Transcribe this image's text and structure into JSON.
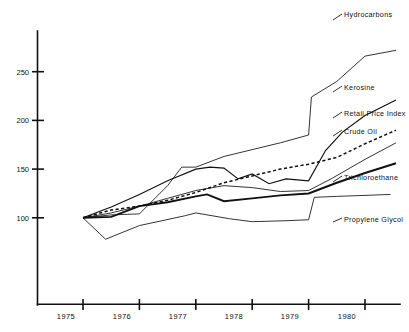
{
  "chart_data": {
    "type": "line",
    "title": "",
    "subtitle": "",
    "xlabel": "",
    "ylabel": "",
    "xlim": [
      1975,
      1980.9
    ],
    "ylim": [
      55,
      290
    ],
    "yticks": [
      100,
      150,
      200,
      250
    ],
    "ytick_labels": [
      "100",
      "150",
      "200",
      "250"
    ],
    "xticks": [
      1975,
      1976,
      1977,
      1978,
      1979,
      1980
    ],
    "xtick_labels": [
      "1975",
      "1976",
      "1977",
      "1978",
      "1979",
      "1980"
    ],
    "grid": false,
    "legend_position": "right-inline-labels",
    "index_base": "1975 = 100",
    "series": [
      {
        "name": "Hydrocarbons",
        "style": "thin-solid",
        "color": "#111111",
        "x": [
          1975.0,
          1975.5,
          1976.0,
          1976.5,
          1976.75,
          1977.0,
          1977.5,
          1978.0,
          1978.5,
          1979.0,
          1979.05,
          1979.5,
          1980.0,
          1980.55
        ],
        "values": [
          100,
          103,
          104,
          133,
          152,
          152,
          163,
          170,
          177,
          185,
          224,
          240,
          266,
          272
        ]
      },
      {
        "name": "Kerosine",
        "style": "medium-solid",
        "color": "#111111",
        "x": [
          1975.0,
          1975.5,
          1976.0,
          1976.5,
          1977.0,
          1977.25,
          1977.5,
          1977.75,
          1978.0,
          1978.3,
          1978.6,
          1979.0,
          1979.3,
          1979.6,
          1980.0,
          1980.55
        ],
        "values": [
          100,
          111,
          124,
          138,
          150,
          152,
          151,
          140,
          145,
          135,
          140,
          138,
          169,
          188,
          205,
          221
        ]
      },
      {
        "name": "Retail Price Index",
        "style": "dashed",
        "color": "#111111",
        "x": [
          1975.0,
          1975.5,
          1976.0,
          1976.5,
          1977.0,
          1977.5,
          1978.0,
          1978.5,
          1979.0,
          1979.5,
          1980.0,
          1980.55
        ],
        "values": [
          100,
          108,
          112,
          118,
          126,
          136,
          143,
          150,
          155,
          162,
          176,
          190
        ]
      },
      {
        "name": "Crude Oil",
        "style": "thin-solid",
        "color": "#111111",
        "x": [
          1975.0,
          1975.5,
          1976.0,
          1976.5,
          1977.0,
          1977.5,
          1978.0,
          1978.5,
          1979.0,
          1979.4,
          1980.0,
          1980.55
        ],
        "values": [
          100,
          105,
          112,
          120,
          128,
          133,
          131,
          127,
          128,
          140,
          160,
          177
        ]
      },
      {
        "name": "Trichloroethane",
        "style": "thick-solid",
        "color": "#111111",
        "x": [
          1975.0,
          1975.5,
          1976.0,
          1976.5,
          1977.0,
          1977.2,
          1977.5,
          1978.0,
          1978.5,
          1979.0,
          1979.5,
          1980.0,
          1980.55
        ],
        "values": [
          100,
          101,
          112,
          116,
          122,
          124,
          117,
          120,
          123,
          125,
          136,
          146,
          156
        ]
      },
      {
        "name": "Propylene Glycol",
        "style": "thin-solid",
        "color": "#111111",
        "x": [
          1975.0,
          1975.4,
          1976.0,
          1976.8,
          1977.0,
          1977.6,
          1978.0,
          1978.6,
          1979.0,
          1979.1,
          1979.5,
          1980.0,
          1980.45
        ],
        "values": [
          100,
          78,
          92,
          102,
          105,
          99,
          96,
          97,
          98,
          121,
          122,
          123,
          124
        ]
      }
    ]
  },
  "labels": {
    "hydrocarbons": "Hydrocarbons",
    "kerosine": "Kerosine",
    "retail_price_index": "Retail Price Index",
    "crude_oil": "Crude Oil",
    "trichloroethane": "Trichloroethane",
    "propylene_glycol": "Propylene Glycol"
  },
  "axes": {
    "y": {
      "t250": "250",
      "t200": "200",
      "t150": "150",
      "t100": "100"
    },
    "x": {
      "y1975": "1975",
      "y1976": "1976",
      "y1977": "1977",
      "y1978": "1978",
      "y1979": "1979",
      "y1980": "1980"
    }
  }
}
